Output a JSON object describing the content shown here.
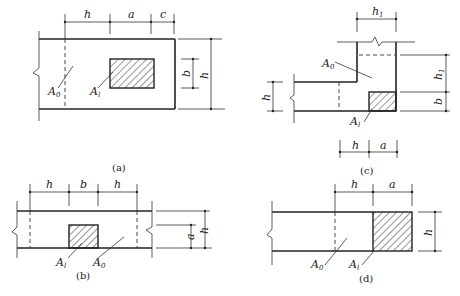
{
  "figures": [
    {
      "id": "a",
      "caption": "(a)",
      "top_dims": [
        "h",
        "a",
        "c"
      ],
      "right_dims": [
        "b",
        "h"
      ],
      "areas": {
        "A0": "A",
        "A0_sub": "0",
        "Al": "A",
        "Al_sub": "l"
      }
    },
    {
      "id": "b",
      "caption": "(b)",
      "top_dims": [
        "h",
        "b",
        "h"
      ],
      "right_dims": [
        "a",
        "h"
      ],
      "areas": {
        "A0": "A",
        "A0_sub": "0",
        "Al": "A",
        "Al_sub": "l"
      }
    },
    {
      "id": "c",
      "caption": "(c)",
      "top_dims": [
        "h",
        "1"
      ],
      "right_dims": [
        "h",
        "1",
        "b"
      ],
      "left_dims": [
        "h"
      ],
      "bottom_dims": [
        "h",
        "a"
      ],
      "areas": {
        "A0": "A",
        "A0_sub": "0",
        "Al": "A",
        "Al_sub": "l"
      }
    },
    {
      "id": "d",
      "caption": "(d)",
      "top_dims": [
        "h",
        "a"
      ],
      "right_dims": [
        "h"
      ],
      "areas": {
        "A0": "A",
        "A0_sub": "0",
        "Al": "A",
        "Al_sub": "l"
      }
    }
  ]
}
